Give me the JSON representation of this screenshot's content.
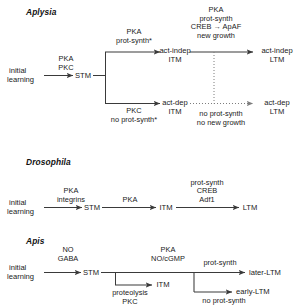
{
  "figure": {
    "background": "#ffffff",
    "line_color": "#3a3a3a",
    "text_color": "#1a1a1a"
  },
  "sections": [
    {
      "title": "Aplysia",
      "nodes": {
        "start_line1": "initial",
        "start_line2": "learning",
        "stm": "STM",
        "act_indep_itm_line1": "act-indep",
        "act_indep_itm_line2": "ITM",
        "act_dep_itm_line1": "act-dep",
        "act_dep_itm_line2": "ITM",
        "act_indep_ltm_line1": "act-indep",
        "act_indep_ltm_line2": "LTM",
        "act_dep_ltm_line1": "act-dep",
        "act_dep_ltm_line2": "LTM"
      },
      "labels": {
        "start_to_stm_line1": "PKA",
        "start_to_stm_line2": "PKC",
        "upper_branch_line1": "PKA",
        "upper_branch_line2": "prot-synth*",
        "lower_branch_line1": "PKC",
        "lower_branch_line2": "no prot-synth*",
        "itm_to_ltm_line1": "PKA",
        "itm_to_ltm_line2": "prot-synth",
        "itm_to_ltm_line3": "CREB → ApAF",
        "itm_to_ltm_line4": "new growth",
        "dotted_line1": "no prot-synth",
        "dotted_line2": "no new growth"
      }
    },
    {
      "title": "Drosophila",
      "nodes": {
        "start_line1": "initial",
        "start_line2": "learning",
        "stm": "STM",
        "itm": "ITM",
        "ltm": "LTM"
      },
      "labels": {
        "start_to_stm_line1": "PKA",
        "start_to_stm_line2": "integrins",
        "stm_to_itm": "PKA",
        "itm_to_ltm_line1": "prot-synth",
        "itm_to_ltm_line2": "CREB",
        "itm_to_ltm_line3": "Adf1"
      }
    },
    {
      "title": "Apis",
      "nodes": {
        "start_line1": "initial",
        "start_line2": "learning",
        "stm": "STM",
        "itm": "ITM",
        "later_ltm": "later-LTM",
        "early_ltm": "early-LTM"
      },
      "labels": {
        "start_to_stm_line1": "NO",
        "start_to_stm_line2": "GABA",
        "stm_to_itm_line1": "proteolysis",
        "stm_to_itm_line2": "PKC",
        "main_line1": "PKA",
        "main_line2": "NO/cGMP",
        "later_branch": "prot-synth",
        "early_branch": "no prot-synth"
      }
    }
  ]
}
